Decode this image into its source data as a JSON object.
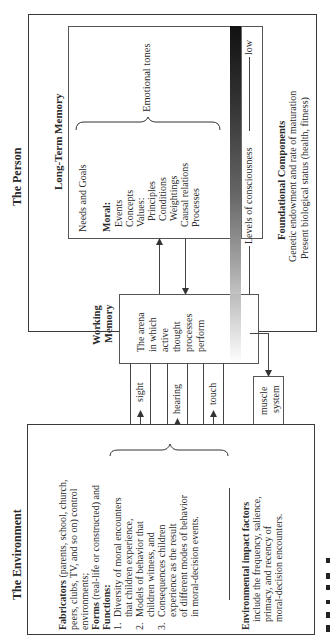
{
  "person": {
    "title": "The Person",
    "long_term_memory": {
      "title": "Long-Term Memory",
      "needs_goals": "Needs and Goals",
      "moral_label": "Moral:",
      "moral_items": [
        "Events",
        "Concepts",
        "Values:"
      ],
      "values_items": [
        "Principles",
        "Conditions",
        "Weightings",
        "Causal relations",
        "Processes"
      ],
      "brace_label": "Emotional tones"
    },
    "consciousness": {
      "label": "Levels of consciousness",
      "high": "high",
      "low": "low"
    },
    "working_memory": {
      "title_line1": "Working",
      "title_line2": "Memory",
      "desc": [
        "The arena",
        "in which",
        "active",
        "thought",
        "processes",
        "perform"
      ]
    },
    "foundational": {
      "title": "Foundational Components",
      "line1": "Genetic endowment and rate of maturation",
      "line2": "Present biological status (health, fitness)"
    }
  },
  "senses": {
    "channels": [
      "sight",
      "hearing",
      "touch"
    ],
    "muscle_line1": "muscle",
    "muscle_line2": "system"
  },
  "environment": {
    "title": "The Environment",
    "fabricators_label": "Fabricators",
    "fabricators_text": [
      " (parents, school, church,",
      "peers, clubs, TV, and so on) control",
      "environments;"
    ],
    "forms_label": "Forms",
    "forms_text": " (real-life or constructed) and",
    "functions_label": "Functions:",
    "functions": [
      {
        "num": "1.",
        "lines": [
          "Diversity of moral encounters",
          "that children experience,"
        ]
      },
      {
        "num": "2.",
        "lines": [
          "Models of behavior that",
          "children witness, and"
        ]
      },
      {
        "num": "3.",
        "lines": [
          "Consequences children",
          "experience as the result",
          "of different modes of behavior",
          "in moral-decision events."
        ]
      }
    ],
    "impact_label": "Environmental impact factors",
    "impact_lines": [
      "include the frequency, salience,",
      "primacy, and recency of",
      "moral-decision encounters."
    ]
  }
}
